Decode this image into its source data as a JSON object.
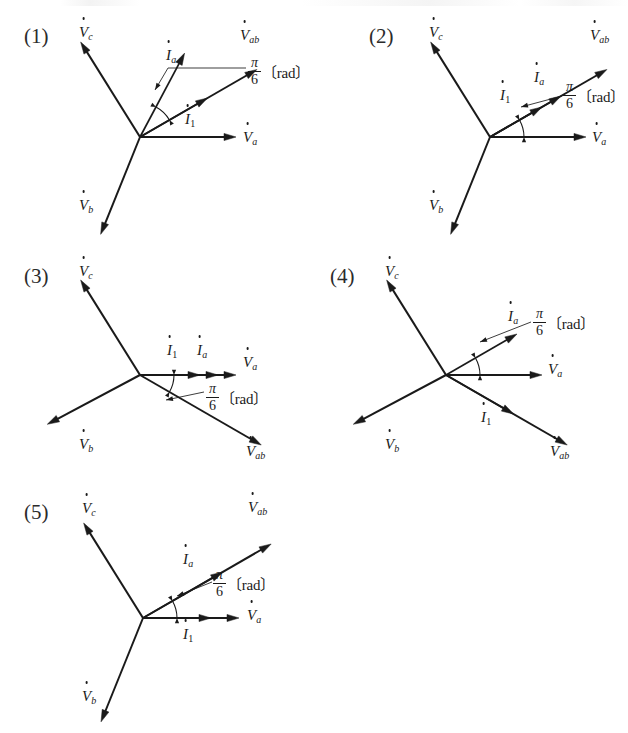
{
  "page": {
    "kind": "multiple-choice-phasor-diagrams",
    "background_color": "#ffffff",
    "ink_color": "#1a1a1a",
    "width": 628,
    "height": 733
  },
  "labels": {
    "V_a": "V",
    "V_b": "V",
    "V_c": "V",
    "V_ab": "V",
    "I_a": "I",
    "I_1": "I",
    "sub_a": "a",
    "sub_b": "b",
    "sub_c": "c",
    "sub_ab": "ab",
    "sub_1": "1",
    "rad_numerator": "π",
    "rad_denominator": "6",
    "rad_unit": "〔rad〕"
  },
  "choices": [
    {
      "id": "choice-1",
      "number": "(1)",
      "number_pos": {
        "x": 24,
        "y": 24
      },
      "origin": {
        "x": 140,
        "y": 137
      },
      "vectors": [
        {
          "name": "V_ab",
          "angle_deg": 30,
          "length": 135,
          "label": "V",
          "sub": "ab",
          "label_pos": {
            "x": 240,
            "y": 28
          }
        },
        {
          "name": "I_a",
          "angle_deg": 62,
          "length": 95,
          "label": "I",
          "sub": "a",
          "label_pos": {
            "x": 166,
            "y": 48
          }
        },
        {
          "name": "I_1",
          "angle_deg": 30,
          "length": 78,
          "label": "I",
          "sub": "1",
          "label_pos": {
            "x": 185,
            "y": 112
          }
        },
        {
          "name": "V_a",
          "angle_deg": 0,
          "length": 96,
          "label": "V",
          "sub": "a",
          "label_pos": {
            "x": 243,
            "y": 130
          }
        },
        {
          "name": "V_c",
          "angle_deg": 122,
          "length": 112,
          "label": "V",
          "sub": "c",
          "label_pos": {
            "x": 79,
            "y": 25
          }
        },
        {
          "name": "V_b",
          "angle_deg": -112,
          "length": 105,
          "label": "V",
          "sub": "b",
          "label_pos": {
            "x": 79,
            "y": 198
          }
        }
      ],
      "angle_marker": {
        "between": [
          "I_1",
          "I_a"
        ],
        "value": "π/6",
        "unit": "〔rad〕"
      },
      "rad_label_pos": {
        "x": 248,
        "y": 56
      },
      "leader": {
        "from": {
          "x": 246,
          "y": 68
        },
        "elbow": {
          "x": 168,
          "y": 68
        },
        "to": {
          "x": 155,
          "y": 90
        }
      }
    },
    {
      "id": "choice-2",
      "number": "(2)",
      "number_pos": {
        "x": 369,
        "y": 24
      },
      "origin": {
        "x": 490,
        "y": 137
      },
      "vectors": [
        {
          "name": "V_ab",
          "angle_deg": 30,
          "length": 135,
          "label": "V",
          "sub": "ab",
          "label_pos": {
            "x": 590,
            "y": 28
          }
        },
        {
          "name": "I_a",
          "angle_deg": 30,
          "length": 82,
          "label": "I",
          "sub": "a",
          "label_pos": {
            "x": 534,
            "y": 70
          }
        },
        {
          "name": "I_1",
          "angle_deg": 30,
          "length": 60,
          "label": "I",
          "sub": "1",
          "label_pos": {
            "x": 500,
            "y": 88
          }
        },
        {
          "name": "V_a",
          "angle_deg": 0,
          "length": 96,
          "label": "V",
          "sub": "a",
          "label_pos": {
            "x": 592,
            "y": 130
          }
        },
        {
          "name": "V_c",
          "angle_deg": 122,
          "length": 112,
          "label": "V",
          "sub": "c",
          "label_pos": {
            "x": 429,
            "y": 25
          }
        },
        {
          "name": "V_b",
          "angle_deg": -112,
          "length": 105,
          "label": "V",
          "sub": "b",
          "label_pos": {
            "x": 429,
            "y": 198
          }
        }
      ],
      "angle_marker": {
        "between": [
          "V_a",
          "I_a"
        ],
        "value": "π/6",
        "unit": "〔rad〕"
      },
      "rad_label_pos": {
        "x": 563,
        "y": 80
      },
      "leader": {
        "from": {
          "x": 562,
          "y": 96
        },
        "elbow": {
          "x": 562,
          "y": 96
        },
        "to": {
          "x": 521,
          "y": 107
        }
      }
    },
    {
      "id": "choice-3",
      "number": "(3)",
      "number_pos": {
        "x": 24,
        "y": 264
      },
      "origin": {
        "x": 140,
        "y": 375
      },
      "vectors": [
        {
          "name": "V_a",
          "angle_deg": 0,
          "length": 96,
          "label": "V",
          "sub": "a",
          "label_pos": {
            "x": 243,
            "y": 355
          }
        },
        {
          "name": "I_a",
          "angle_deg": 0,
          "length": 78,
          "label": "I",
          "sub": "a",
          "label_pos": {
            "x": 197,
            "y": 343
          }
        },
        {
          "name": "I_1",
          "angle_deg": 0,
          "length": 60,
          "label": "I",
          "sub": "1",
          "label_pos": {
            "x": 167,
            "y": 343
          }
        },
        {
          "name": "V_ab",
          "angle_deg": -30,
          "length": 140,
          "label": "V",
          "sub": "ab",
          "label_pos": {
            "x": 246,
            "y": 444
          }
        },
        {
          "name": "V_c",
          "angle_deg": 122,
          "length": 112,
          "label": "V",
          "sub": "c",
          "label_pos": {
            "x": 79,
            "y": 264
          }
        },
        {
          "name": "V_b",
          "angle_deg": -152,
          "length": 105,
          "label": "V",
          "sub": "b",
          "label_pos": {
            "x": 79,
            "y": 437
          }
        }
      ],
      "angle_marker": {
        "between": [
          "V_ab",
          "V_a"
        ],
        "value": "π/6",
        "unit": "〔rad〕"
      },
      "rad_label_pos": {
        "x": 206,
        "y": 382
      },
      "leader": {
        "from": {
          "x": 204,
          "y": 392
        },
        "elbow": {
          "x": 204,
          "y": 392
        },
        "to": {
          "x": 166,
          "y": 400
        }
      }
    },
    {
      "id": "choice-4",
      "number": "(4)",
      "number_pos": {
        "x": 330,
        "y": 264
      },
      "origin": {
        "x": 446,
        "y": 375
      },
      "vectors": [
        {
          "name": "I_a",
          "angle_deg": 30,
          "length": 82,
          "label": "I",
          "sub": "a",
          "label_pos": {
            "x": 508,
            "y": 309
          }
        },
        {
          "name": "V_a",
          "angle_deg": 0,
          "length": 96,
          "label": "V",
          "sub": "a",
          "label_pos": {
            "x": 548,
            "y": 362
          }
        },
        {
          "name": "I_1",
          "angle_deg": -30,
          "length": 78,
          "label": "I",
          "sub": "1",
          "label_pos": {
            "x": 481,
            "y": 410
          }
        },
        {
          "name": "V_ab",
          "angle_deg": -30,
          "length": 140,
          "label": "V",
          "sub": "ab",
          "label_pos": {
            "x": 550,
            "y": 444
          }
        },
        {
          "name": "V_c",
          "angle_deg": 122,
          "length": 112,
          "label": "V",
          "sub": "c",
          "label_pos": {
            "x": 385,
            "y": 264
          }
        },
        {
          "name": "V_b",
          "angle_deg": -152,
          "length": 105,
          "label": "V",
          "sub": "b",
          "label_pos": {
            "x": 385,
            "y": 437
          }
        }
      ],
      "angle_marker": {
        "between": [
          "V_a",
          "I_a"
        ],
        "value": "π/6",
        "unit": "〔rad〕"
      },
      "rad_label_pos": {
        "x": 533,
        "y": 307
      },
      "leader": {
        "from": {
          "x": 531,
          "y": 322
        },
        "elbow": {
          "x": 531,
          "y": 322
        },
        "to": {
          "x": 480,
          "y": 342
        }
      }
    },
    {
      "id": "choice-5",
      "number": "(5)",
      "number_pos": {
        "x": 24,
        "y": 500
      },
      "origin": {
        "x": 143,
        "y": 618
      },
      "vectors": [
        {
          "name": "V_ab",
          "angle_deg": 30,
          "length": 148,
          "label": "V",
          "sub": "ab",
          "label_pos": {
            "x": 248,
            "y": 500
          }
        },
        {
          "name": "I_a",
          "angle_deg": 30,
          "length": 92,
          "label": "I",
          "sub": "a",
          "label_pos": {
            "x": 183,
            "y": 552
          }
        },
        {
          "name": "V_a",
          "angle_deg": 0,
          "length": 96,
          "label": "V",
          "sub": "a",
          "label_pos": {
            "x": 247,
            "y": 608
          }
        },
        {
          "name": "I_1",
          "angle_deg": 0,
          "length": 68,
          "label": "I",
          "sub": "1",
          "label_pos": {
            "x": 183,
            "y": 627
          }
        },
        {
          "name": "V_c",
          "angle_deg": 122,
          "length": 112,
          "label": "V",
          "sub": "c",
          "label_pos": {
            "x": 82,
            "y": 501
          }
        },
        {
          "name": "V_b",
          "angle_deg": -112,
          "length": 112,
          "label": "V",
          "sub": "b",
          "label_pos": {
            "x": 82,
            "y": 689
          }
        }
      ],
      "angle_marker": {
        "between": [
          "V_a",
          "I_a"
        ],
        "value": "π/6",
        "unit": "〔rad〕"
      },
      "rad_label_pos": {
        "x": 213,
        "y": 568
      },
      "leader": {
        "from": {
          "x": 212,
          "y": 582
        },
        "elbow": {
          "x": 212,
          "y": 582
        },
        "to": {
          "x": 177,
          "y": 596
        }
      }
    }
  ]
}
